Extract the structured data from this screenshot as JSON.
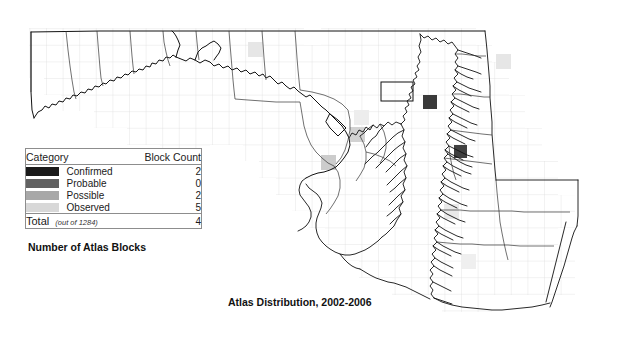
{
  "figure": {
    "title": "Atlas Distribution, 2002-2006",
    "subtitle": "Number of Atlas Blocks"
  },
  "legend": {
    "header": {
      "category": "Category",
      "block_count": "Block Count"
    },
    "rows": [
      {
        "label": "Confirmed",
        "count": "2",
        "color": "#1a1a1a"
      },
      {
        "label": "Probable",
        "count": "0",
        "color": "#616161"
      },
      {
        "label": "Possible",
        "count": "2",
        "color": "#a8a8a8"
      },
      {
        "label": "Observed",
        "count": "5",
        "color": "#d8d8d8"
      }
    ],
    "total": {
      "label": "Total",
      "note": "(out of 1284)",
      "count": "4"
    }
  },
  "map": {
    "region_name": "Maryland",
    "grid": {
      "cell_px": 16.6,
      "line_color": "#d9d9d9"
    },
    "outline_color": "#111111",
    "background": "#ffffff",
    "blocks": [
      {
        "category": "Observed",
        "color": "#e2e2e2",
        "x": 248,
        "y": 42
      },
      {
        "category": "Observed",
        "color": "#e2e2e2",
        "x": 497,
        "y": 55
      },
      {
        "category": "Confirmed",
        "color": "#3a3a3a",
        "x": 424,
        "y": 96
      },
      {
        "category": "Observed",
        "color": "#ececec",
        "x": 355,
        "y": 111
      },
      {
        "category": "Possible",
        "color": "#cfcfcf",
        "x": 351,
        "y": 128
      },
      {
        "category": "Possible",
        "color": "#c9c9c9",
        "x": 322,
        "y": 156
      },
      {
        "category": "Confirmed",
        "color": "#3f3f3f",
        "x": 455,
        "y": 146
      },
      {
        "category": "Observed",
        "color": "#e8e8e8",
        "x": 445,
        "y": 205
      },
      {
        "category": "Observed",
        "color": "#ededed",
        "x": 462,
        "y": 255
      }
    ],
    "highlight_block": {
      "x": 381,
      "y": 82,
      "w": 32,
      "h": 19
    }
  }
}
